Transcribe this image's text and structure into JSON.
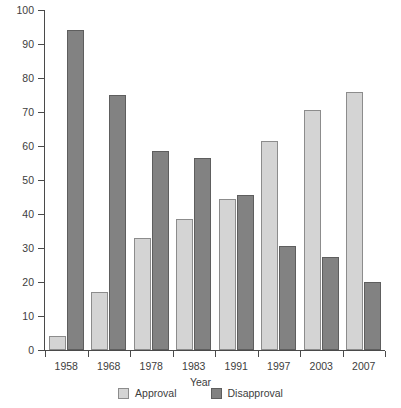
{
  "chart_data": {
    "type": "bar",
    "title": "",
    "xlabel": "Year",
    "ylabel": "Percent",
    "ylim": [
      0,
      100
    ],
    "yticks": [
      0,
      10,
      20,
      30,
      40,
      50,
      60,
      70,
      80,
      90,
      100
    ],
    "grid": false,
    "legend_position": "bottom",
    "categories": [
      "1958",
      "1968",
      "1978",
      "1983",
      "1991",
      "1997",
      "2003",
      "2007"
    ],
    "series": [
      {
        "name": "Approval",
        "color": "#d4d4d4",
        "values": [
          4,
          17,
          33,
          38.5,
          44.5,
          61.5,
          70.5,
          76
        ]
      },
      {
        "name": "Disapproval",
        "color": "#828282",
        "values": [
          94,
          75,
          58.5,
          56.5,
          45.5,
          30.5,
          27.5,
          20
        ]
      }
    ]
  },
  "legend": {
    "items": [
      {
        "label": "Approval",
        "swatch": "approval"
      },
      {
        "label": "Disapproval",
        "swatch": "disapproval"
      }
    ]
  }
}
